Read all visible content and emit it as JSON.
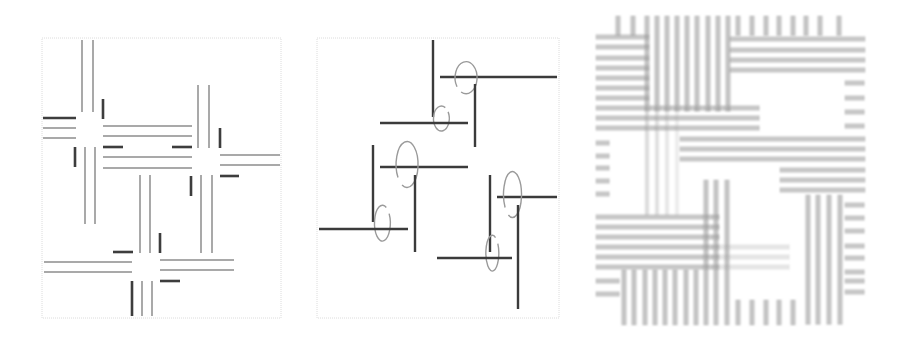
{
  "figure": {
    "panels": [
      {
        "id": "panel-a",
        "description": "Four cross-shaped junctions formed by paired gray lines with dark short markers",
        "colors": {
          "light_line": "#a9a9a9",
          "dark_line": "#3c3c3c",
          "frame": "#dcdcdc"
        },
        "junction_count": 4
      },
      {
        "id": "panel-b",
        "description": "Three pinwheel motifs of dark lines each enclosing a spiral ellipse",
        "colors": {
          "dark_line": "#3a3a3a",
          "spiral": "#9a9a9a",
          "frame": "#dcdcdc"
        },
        "motif_count": 3
      },
      {
        "id": "panel-c",
        "description": "Dense overlapping grid of thick blurred gray bars",
        "colors": {
          "bar": "#9e9e9e"
        }
      }
    ]
  }
}
